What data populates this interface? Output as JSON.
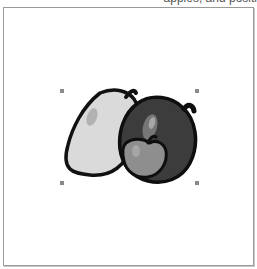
{
  "caption": {
    "text": "apples, and positi"
  },
  "canvas": {
    "object": "apples-clipart",
    "selection_handles": [
      {
        "name": "top-left",
        "x": 62,
        "y": 91
      },
      {
        "name": "top-right",
        "x": 197,
        "y": 91
      },
      {
        "name": "bottom-left",
        "x": 62,
        "y": 183
      },
      {
        "name": "bottom-right",
        "x": 197,
        "y": 183
      }
    ]
  },
  "colors": {
    "frame_border": "#9a9a9a",
    "handle": "#8a8a8a",
    "light_apple": "#d9d9d9",
    "dark_apple": "#3a3a3a",
    "small_apple": "#8c8c8c",
    "outline": "#111111"
  }
}
